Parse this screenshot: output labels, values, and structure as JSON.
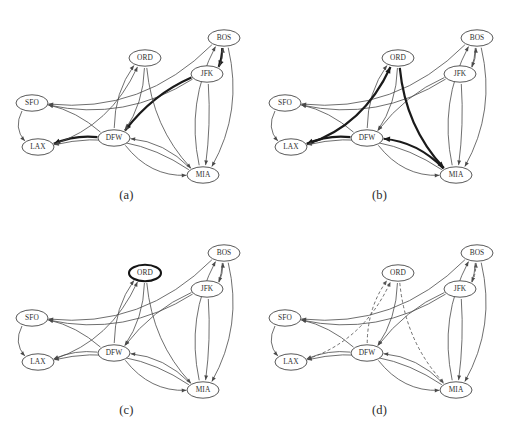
{
  "figure": {
    "background": "#ffffff",
    "width": 507,
    "height": 431,
    "colors": {
      "edge": "#4a4a4a",
      "edge_highlight": "#1a1a1a",
      "edge_dashed": "#555555",
      "node_stroke": "#3a3a3a",
      "node_stroke_bold": "#151515",
      "node_fill": "#ffffff",
      "text": "#2f2f2f"
    }
  },
  "airports": [
    {
      "code": "SFO",
      "x": 32,
      "y": 103
    },
    {
      "code": "LAX",
      "x": 38,
      "y": 147
    },
    {
      "code": "DFW",
      "x": 114,
      "y": 138
    },
    {
      "code": "ORD",
      "x": 145,
      "y": 58
    },
    {
      "code": "MIA",
      "x": 203,
      "y": 175
    },
    {
      "code": "JFK",
      "x": 207,
      "y": 74
    },
    {
      "code": "BOS",
      "x": 224,
      "y": 38
    }
  ],
  "panels": [
    {
      "id": "a",
      "caption": "(a)",
      "origin_x": 0,
      "origin_y": 0,
      "highlight_kind": "bold-path",
      "highlighted_nodes": [],
      "highlighted_edges": [
        "BOS->JFK",
        "JFK->DFW",
        "DFW->LAX"
      ]
    },
    {
      "id": "b",
      "caption": "(b)",
      "origin_x": 253,
      "origin_y": 0,
      "highlight_kind": "bold-cycle",
      "highlighted_nodes": [],
      "highlighted_edges": [
        "LAX->ORD",
        "ORD->MIA",
        "MIA->DFW",
        "DFW->LAX"
      ]
    },
    {
      "id": "c",
      "caption": "(c)",
      "origin_x": 0,
      "origin_y": 215,
      "highlight_kind": "bold-vertex",
      "highlighted_nodes": [
        "ORD"
      ],
      "highlighted_edges": []
    },
    {
      "id": "d",
      "caption": "(d)",
      "origin_x": 253,
      "origin_y": 215,
      "highlight_kind": "dashed-edges",
      "highlighted_nodes": [],
      "dashed_edges": [
        "LAX->ORD",
        "DFW->ORD",
        "ORD->MIA",
        "JFK->BOS"
      ]
    }
  ],
  "edges": [
    {
      "id": "BOS->SFO",
      "from": "BOS",
      "to": "SFO",
      "label": "BOS to SFO"
    },
    {
      "id": "BOS->JFK",
      "from": "BOS",
      "to": "JFK",
      "label": "BOS to JFK"
    },
    {
      "id": "BOS->MIA",
      "from": "BOS",
      "to": "MIA",
      "label": "BOS to MIA"
    },
    {
      "id": "JFK->BOS",
      "from": "JFK",
      "to": "BOS",
      "label": "JFK to BOS"
    },
    {
      "id": "JFK->SFO",
      "from": "JFK",
      "to": "SFO",
      "label": "JFK to SFO"
    },
    {
      "id": "JFK->DFW",
      "from": "JFK",
      "to": "DFW",
      "label": "JFK to DFW"
    },
    {
      "id": "JFK->MIA",
      "from": "JFK",
      "to": "MIA",
      "label": "JFK to MIA"
    },
    {
      "id": "ORD->DFW",
      "from": "ORD",
      "to": "DFW",
      "label": "ORD to DFW"
    },
    {
      "id": "ORD->MIA",
      "from": "ORD",
      "to": "MIA",
      "label": "ORD to MIA"
    },
    {
      "id": "DFW->ORD",
      "from": "DFW",
      "to": "ORD",
      "label": "DFW to ORD"
    },
    {
      "id": "DFW->SFO",
      "from": "DFW",
      "to": "SFO",
      "label": "DFW to SFO"
    },
    {
      "id": "DFW->LAX",
      "from": "DFW",
      "to": "LAX",
      "label": "DFW to LAX"
    },
    {
      "id": "DFW->MIA",
      "from": "DFW",
      "to": "MIA",
      "label": "DFW to MIA"
    },
    {
      "id": "LAX->ORD",
      "from": "LAX",
      "to": "ORD",
      "label": "LAX to ORD"
    },
    {
      "id": "MIA->LAX",
      "from": "MIA",
      "to": "LAX",
      "label": "MIA to LAX"
    },
    {
      "id": "MIA->DFW",
      "from": "MIA",
      "to": "DFW",
      "label": "MIA to DFW"
    },
    {
      "id": "MIA->BOS",
      "from": "MIA",
      "to": "BOS",
      "label": "MIA to BOS"
    },
    {
      "id": "SFO->LAX",
      "from": "SFO",
      "to": "LAX",
      "label": "SFO to LAX"
    }
  ]
}
